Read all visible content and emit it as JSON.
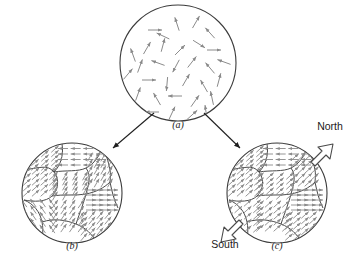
{
  "figure": {
    "background": "#ffffff",
    "stroke_color": "#3b3b3b",
    "arrow_color": "#8a8a8a",
    "outline_arrow_color": "#4a4a4a",
    "connector_color": "#1f1f1f"
  },
  "panels": [
    {
      "id": "a",
      "label": "(a)",
      "label_x": 178,
      "label_y": 128,
      "center_x": 178,
      "center_y": 63,
      "radius": 58,
      "description": "randomly-oriented-dipoles"
    },
    {
      "id": "b",
      "label": "(b)",
      "label_x": 72,
      "label_y": 249,
      "center_x": 72,
      "center_y": 193,
      "radius": 50,
      "description": "polycrystalline-domains-unmagnetized"
    },
    {
      "id": "c",
      "label": "(c)",
      "label_x": 277,
      "label_y": 249,
      "center_x": 277,
      "center_y": 193,
      "radius": 50,
      "description": "polycrystalline-domains-magnetized"
    }
  ],
  "pole_labels": {
    "north": "North",
    "south": "South",
    "north_x": 330,
    "north_y": 130,
    "south_x": 225,
    "south_y": 248
  },
  "chart_data": {
    "type": "diagram",
    "title": "",
    "panel_a_dipoles": [
      {
        "x": 155,
        "y": 30,
        "angle": 0
      },
      {
        "x": 177,
        "y": 24,
        "angle": 252
      },
      {
        "x": 196,
        "y": 22,
        "angle": 300
      },
      {
        "x": 210,
        "y": 33,
        "angle": 228
      },
      {
        "x": 147,
        "y": 48,
        "angle": 300
      },
      {
        "x": 163,
        "y": 45,
        "angle": 285
      },
      {
        "x": 180,
        "y": 50,
        "angle": 315
      },
      {
        "x": 199,
        "y": 44,
        "angle": 32
      },
      {
        "x": 214,
        "y": 50,
        "angle": 0
      },
      {
        "x": 133,
        "y": 55,
        "angle": 250
      },
      {
        "x": 140,
        "y": 66,
        "angle": 290
      },
      {
        "x": 158,
        "y": 63,
        "angle": 200
      },
      {
        "x": 176,
        "y": 66,
        "angle": 118
      },
      {
        "x": 192,
        "y": 62,
        "angle": 308
      },
      {
        "x": 210,
        "y": 68,
        "angle": 230
      },
      {
        "x": 149,
        "y": 80,
        "angle": 0
      },
      {
        "x": 167,
        "y": 84,
        "angle": 95
      },
      {
        "x": 186,
        "y": 80,
        "angle": 300
      },
      {
        "x": 204,
        "y": 86,
        "angle": 240
      },
      {
        "x": 219,
        "y": 80,
        "angle": 285
      },
      {
        "x": 138,
        "y": 94,
        "angle": 290
      },
      {
        "x": 157,
        "y": 99,
        "angle": 240
      },
      {
        "x": 175,
        "y": 96,
        "angle": 180
      },
      {
        "x": 195,
        "y": 101,
        "angle": 305
      },
      {
        "x": 212,
        "y": 98,
        "angle": 258
      },
      {
        "x": 152,
        "y": 112,
        "angle": 180
      },
      {
        "x": 172,
        "y": 113,
        "angle": 295
      },
      {
        "x": 192,
        "y": 115,
        "angle": 318
      },
      {
        "x": 206,
        "y": 112,
        "angle": 262
      },
      {
        "x": 163,
        "y": 36,
        "angle": 205
      },
      {
        "x": 128,
        "y": 74,
        "angle": 310
      },
      {
        "x": 224,
        "y": 62,
        "angle": 200
      }
    ],
    "panel_b_grains": [
      {
        "name": "grain-top-left",
        "arrow_angle": 318
      },
      {
        "name": "grain-top-right",
        "arrow_angle": 318
      },
      {
        "name": "grain-left",
        "arrow_angle": 180
      },
      {
        "name": "grain-center",
        "arrow_angle": 300
      },
      {
        "name": "grain-right-upper",
        "arrow_angle": 300
      },
      {
        "name": "grain-right-lower",
        "arrow_angle": 0
      },
      {
        "name": "grain-bottom-left",
        "arrow_angle": 235
      },
      {
        "name": "grain-bottom-center",
        "arrow_angle": 305
      },
      {
        "name": "grain-bottom-right",
        "arrow_angle": 310
      }
    ],
    "panel_c_grains": [
      {
        "name": "grain-top-left",
        "arrow_angle": 318
      },
      {
        "name": "grain-top-right",
        "arrow_angle": 318
      },
      {
        "name": "grain-left",
        "arrow_angle": 180
      },
      {
        "name": "grain-center",
        "arrow_angle": 318
      },
      {
        "name": "grain-right-upper",
        "arrow_angle": 318
      },
      {
        "name": "grain-right-lower",
        "arrow_angle": 0
      },
      {
        "name": "grain-bottom-left",
        "arrow_angle": 318
      },
      {
        "name": "grain-bottom-center",
        "arrow_angle": 318
      },
      {
        "name": "grain-bottom-right",
        "arrow_angle": 318
      }
    ]
  }
}
